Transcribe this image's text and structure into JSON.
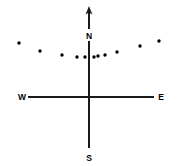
{
  "figure": {
    "width": 181,
    "height": 166,
    "background_color": "#ffffff",
    "ink_color": "#000000"
  },
  "labels": {
    "north": "N",
    "south": "S",
    "east": "E",
    "west": "W"
  },
  "chart_data": {
    "type": "scatter",
    "title": "",
    "subtitle": "",
    "xlabel": "",
    "ylabel": "",
    "grid": false,
    "legend": false,
    "legend_position": "none",
    "axes": {
      "vertical": {
        "label_top": "N",
        "label_bottom": "S",
        "arrow_at_top": true,
        "x_px": 89,
        "y_top_px": 10,
        "y_bottom_px": 148
      },
      "horizontal": {
        "label_left": "W",
        "label_right": "E",
        "arrow": false,
        "y_px": 97,
        "x_left_px": 28,
        "x_right_px": 154
      },
      "origin_tick": {
        "x_px": 89,
        "y_px": 97,
        "shape": "plus",
        "size_px": 9
      }
    },
    "label_positions": [
      {
        "text": "N",
        "x": 89,
        "y": 36
      },
      {
        "text": "S",
        "x": 89,
        "y": 158
      },
      {
        "text": "W",
        "x": 23,
        "y": 97
      },
      {
        "text": "E",
        "x": 160,
        "y": 97
      }
    ],
    "point_radius_px": 1.7,
    "points": [
      {
        "x": 19,
        "y": 43
      },
      {
        "x": 40,
        "y": 51
      },
      {
        "x": 62,
        "y": 55
      },
      {
        "x": 77,
        "y": 57
      },
      {
        "x": 85,
        "y": 57
      },
      {
        "x": 94,
        "y": 57
      },
      {
        "x": 98,
        "y": 56
      },
      {
        "x": 105,
        "y": 55
      },
      {
        "x": 117,
        "y": 52
      },
      {
        "x": 140,
        "y": 46
      },
      {
        "x": 159,
        "y": 41
      }
    ],
    "point_count": 11,
    "xlim": [
      0,
      181
    ],
    "ylim": [
      166,
      0
    ]
  }
}
